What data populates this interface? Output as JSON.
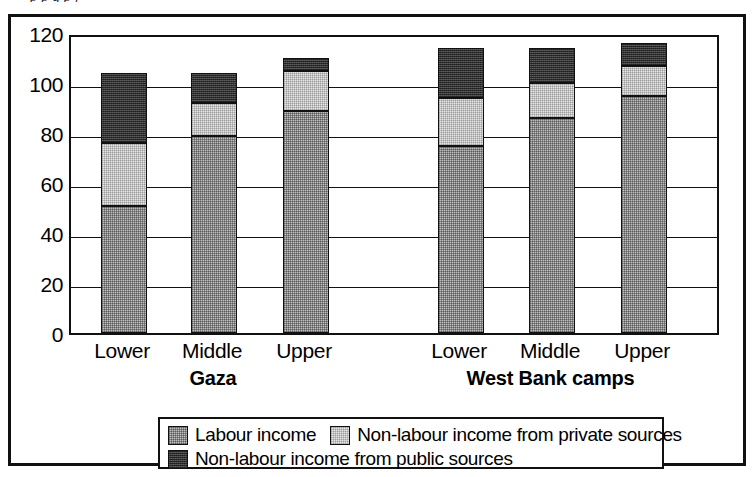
{
  "caption_fragment": "p                                  p          g    p  j",
  "chart_data": {
    "type": "bar",
    "subtype": "stacked-column",
    "title": "",
    "xlabel": "",
    "ylabel": "",
    "ylim": [
      0,
      120
    ],
    "yticks": [
      0,
      20,
      40,
      60,
      80,
      100,
      120
    ],
    "ytick_labels": [
      "0",
      "20",
      "40",
      "60",
      "80",
      "100",
      "120"
    ],
    "grid": true,
    "grid_axis": "y",
    "legend_position": "bottom",
    "groups": [
      {
        "name": "Gaza",
        "categories": [
          "Lower",
          "Middle",
          "Upper"
        ]
      },
      {
        "name": "West Bank camps",
        "categories": [
          "Lower",
          "Middle",
          "Upper"
        ]
      }
    ],
    "categories": [
      "Lower",
      "Middle",
      "Upper",
      "Lower",
      "Middle",
      "Upper"
    ],
    "series": [
      {
        "name": "Labour income",
        "color": "#bfbfbf",
        "values": [
          51,
          79,
          89,
          75,
          86,
          95
        ]
      },
      {
        "name": "Non-labour income from private sources",
        "color": "#e6e6e6",
        "values": [
          25,
          13,
          16,
          19,
          14,
          12
        ]
      },
      {
        "name": "Non-labour income from public sources",
        "color": "#4a4a4a",
        "values": [
          28,
          12,
          5,
          20,
          14,
          9
        ]
      }
    ],
    "totals": [
      104,
      104,
      110,
      114,
      114,
      116
    ]
  },
  "axis": {
    "ticks": [
      {
        "label": "120",
        "value": 120
      },
      {
        "label": "100",
        "value": 100
      },
      {
        "label": "80",
        "value": 80
      },
      {
        "label": "60",
        "value": 60
      },
      {
        "label": "40",
        "value": 40
      },
      {
        "label": "20",
        "value": 20
      },
      {
        "label": "0",
        "value": 0
      }
    ]
  },
  "x_labels": [
    "Lower",
    "Middle",
    "Upper",
    "Lower",
    "Middle",
    "Upper"
  ],
  "group_labels": [
    "Gaza",
    "West Bank camps"
  ],
  "legend": {
    "items": [
      {
        "label": "Labour income",
        "swatch": "labour"
      },
      {
        "label": "Non-labour income from private sources",
        "swatch": "private"
      },
      {
        "label": "Non-labour income from public sources",
        "swatch": "public"
      }
    ]
  },
  "colors": {
    "labour": "#bfbfbf",
    "private": "#e6e6e6",
    "public": "#4a4a4a",
    "ink": "#111111",
    "paper": "#ffffff"
  }
}
